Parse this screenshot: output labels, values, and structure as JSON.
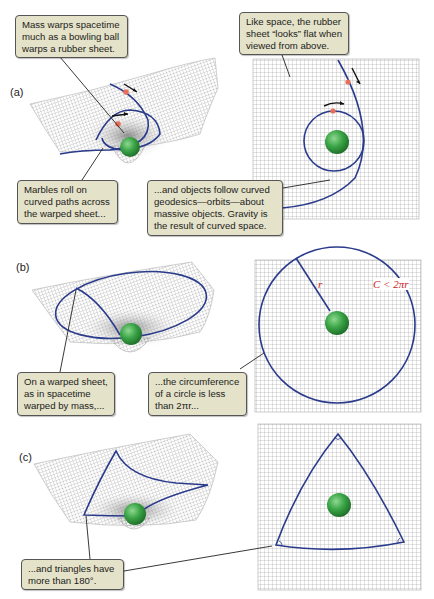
{
  "figure": {
    "panels": [
      {
        "label": "(a)",
        "callouts": [
          {
            "lines": [
              "Mass warps spacetime",
              "much as a bowling ball",
              "warps a rubber sheet."
            ]
          },
          {
            "lines": [
              "Like space, the rubber",
              "sheet “looks” flat when",
              "viewed from above."
            ]
          },
          {
            "lines": [
              "Marbles roll on",
              "curved paths across",
              "the warped sheet..."
            ]
          },
          {
            "lines": [
              "...and objects follow curved",
              "geodesics—orbits—about",
              "massive objects. Gravity is",
              "the result of curved space."
            ]
          }
        ]
      },
      {
        "label": "(b)",
        "callouts": [
          {
            "lines": [
              "On a warped sheet,",
              "as in spacetime",
              "warped by mass,..."
            ]
          },
          {
            "lines": [
              "...the circumference",
              "of a circle is less",
              "than 2πr..."
            ]
          }
        ],
        "radius_label": "r",
        "circumference_label": "C < 2πr"
      },
      {
        "label": "(c)",
        "callouts": [
          {
            "lines": [
              "...and triangles have",
              "more than 180°."
            ]
          }
        ]
      }
    ],
    "colors": {
      "callout_bg": "#e4e2c8",
      "callout_border": "#555555",
      "curve": "#2b3b8c",
      "mass": "#2f9a3a",
      "marble": "#e8705a",
      "grid": "#9a9a9a",
      "label_red": "#cc2222"
    }
  }
}
